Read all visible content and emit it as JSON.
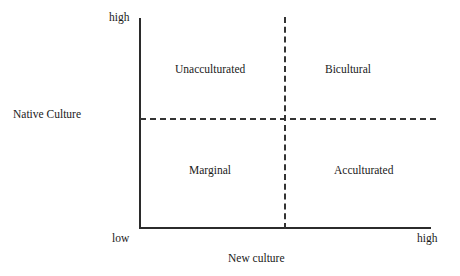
{
  "figure": {
    "width": 460,
    "height": 276,
    "background_color": "#ffffff",
    "line_color": "#2b2b2b",
    "text_color": "#1a1a1a"
  },
  "axes": {
    "y_axis": {
      "title": "Native Culture",
      "high_label": "high",
      "low_label": "low",
      "style": "solid"
    },
    "x_axis": {
      "title": "New culture",
      "high_label": "high",
      "low_label": "low",
      "style": "solid"
    }
  },
  "dividers": {
    "vertical": {
      "style": "dashed"
    },
    "horizontal": {
      "style": "dashed"
    }
  },
  "quadrants": [
    {
      "position": "upper-left",
      "label": "Unacculturated"
    },
    {
      "position": "upper-right",
      "label": "Bicultural"
    },
    {
      "position": "lower-left",
      "label": "Marginal"
    },
    {
      "position": "lower-right",
      "label": "Acculturated"
    }
  ]
}
